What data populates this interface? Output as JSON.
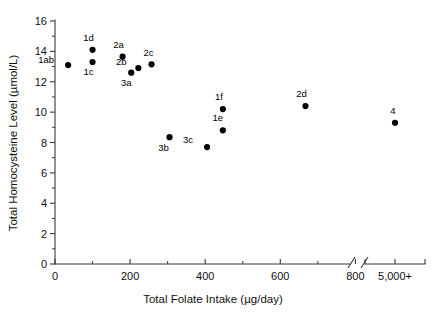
{
  "chart_data": {
    "type": "scatter",
    "title": "",
    "xlabel": "Total Folate Intake (µg/day)",
    "ylabel": "Total Homocysteine Level (µmol/L)",
    "xlim": [
      0,
      880
    ],
    "ylim": [
      0,
      16
    ],
    "grid": false,
    "legend": "none",
    "axis_break": {
      "present": true,
      "after_value": 850,
      "resumed_label": "5,000+"
    },
    "x_ticks_major": [
      0,
      200,
      400,
      600,
      800
    ],
    "x_tick_labels": [
      "0",
      "200",
      "400",
      "600",
      "800"
    ],
    "x_ticks_minor": [
      100,
      300,
      500,
      700
    ],
    "x_break_tick_label": "5,000+",
    "y_ticks_major": [
      0,
      2,
      4,
      6,
      8,
      10,
      12,
      14,
      16
    ],
    "y_tick_labels": [
      "0",
      "2",
      "4",
      "6",
      "8",
      "10",
      "12",
      "14",
      "16"
    ],
    "y_ticks_minor": [
      1,
      3,
      5,
      7,
      9,
      11,
      13,
      15
    ],
    "points": [
      {
        "label": "1ab",
        "x": 35,
        "y": 13.1,
        "label_dx": -22,
        "label_dy": -2,
        "broken_axis": false
      },
      {
        "label": "1d",
        "x": 100,
        "y": 14.1,
        "label_dx": -4,
        "label_dy": -9,
        "broken_axis": false
      },
      {
        "label": "1c",
        "x": 100,
        "y": 13.3,
        "label_dx": -4,
        "label_dy": 13,
        "broken_axis": false
      },
      {
        "label": "2a",
        "x": 180,
        "y": 13.65,
        "label_dx": -4,
        "label_dy": -9,
        "broken_axis": false
      },
      {
        "label": "2b",
        "x": 222,
        "y": 12.9,
        "label_dx": -17,
        "label_dy": -3,
        "broken_axis": false
      },
      {
        "label": "2c",
        "x": 257,
        "y": 13.15,
        "label_dx": -3,
        "label_dy": -8,
        "broken_axis": false
      },
      {
        "label": "3a",
        "x": 203,
        "y": 12.6,
        "label_dx": -5,
        "label_dy": 13,
        "broken_axis": false
      },
      {
        "label": "3b",
        "x": 305,
        "y": 8.35,
        "label_dx": -6,
        "label_dy": 14,
        "broken_axis": false
      },
      {
        "label": "3c",
        "x": 405,
        "y": 7.7,
        "label_dx": -19,
        "label_dy": -4,
        "broken_axis": false
      },
      {
        "label": "1e",
        "x": 447,
        "y": 8.8,
        "label_dx": -5,
        "label_dy": -9,
        "broken_axis": false
      },
      {
        "label": "1f",
        "x": 447,
        "y": 10.2,
        "label_dx": -4,
        "label_dy": -9,
        "broken_axis": false
      },
      {
        "label": "2d",
        "x": 667,
        "y": 10.4,
        "label_dx": -4,
        "label_dy": -9,
        "broken_axis": false
      },
      {
        "label": "4",
        "x": 5000,
        "y": 9.3,
        "label_dx": -2,
        "label_dy": -9,
        "broken_axis": true
      }
    ],
    "colors": {
      "point": "#000000",
      "axis": "#3a3a3a",
      "text": "#111111",
      "background": "#ffffff"
    }
  }
}
